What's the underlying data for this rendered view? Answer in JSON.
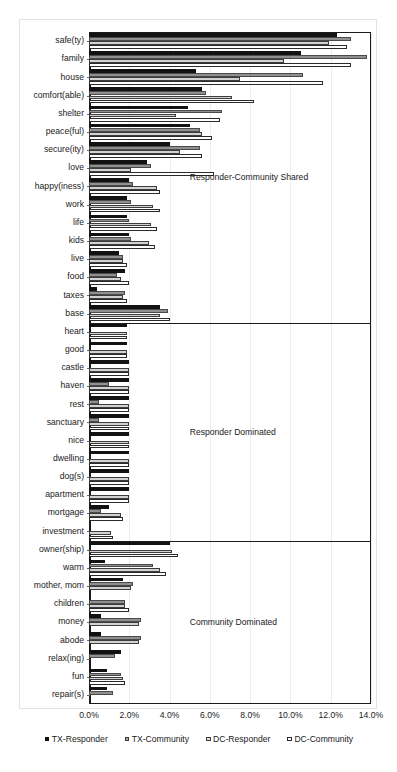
{
  "chart_data": {
    "type": "bar",
    "orientation": "horizontal",
    "title": "",
    "xlabel": "",
    "ylabel": "",
    "xlim": [
      0,
      14
    ],
    "xticks": [
      "0.0%",
      "2.0%",
      "4.0%",
      "6.0%",
      "8.0%",
      "10.0%",
      "12.0%",
      "14.0%"
    ],
    "xtick_values": [
      0,
      2,
      4,
      6,
      8,
      10,
      12,
      14
    ],
    "grid": true,
    "legend_position": "bottom",
    "categories": [
      "safe(ty)",
      "family",
      "house",
      "comfort(able)",
      "shelter",
      "peace(ful)",
      "secure(ity)",
      "love",
      "happy(iness)",
      "work",
      "life",
      "kids",
      "live",
      "food",
      "taxes",
      "base",
      "heart",
      "good",
      "castle",
      "haven",
      "rest",
      "sanctuary",
      "nice",
      "dwelling",
      "dog(s)",
      "apartment",
      "mortgage",
      "investment",
      "owner(ship)",
      "warm",
      "mother, mom",
      "children",
      "money",
      "abode",
      "relax(ing)",
      "fun",
      "repair(s)"
    ],
    "series": [
      {
        "name": "TX-Responder",
        "color": "#121212",
        "values": [
          12.3,
          10.5,
          5.3,
          5.6,
          4.9,
          5.0,
          4.0,
          2.9,
          2.0,
          1.9,
          1.9,
          2.0,
          1.5,
          1.8,
          0.4,
          3.5,
          1.9,
          1.9,
          2.0,
          2.0,
          2.0,
          2.0,
          2.0,
          2.0,
          2.0,
          2.0,
          1.0,
          0.0,
          4.0,
          0.8,
          1.7,
          0.0,
          0.6,
          0.6,
          1.6,
          0.9,
          0.9
        ]
      },
      {
        "name": "TX-Community",
        "color": "#8f8f8f",
        "values": [
          13.0,
          13.8,
          10.6,
          5.8,
          6.6,
          5.5,
          5.5,
          3.1,
          2.2,
          2.1,
          2.0,
          2.1,
          1.7,
          1.4,
          1.8,
          3.9,
          0.0,
          0.0,
          0.0,
          1.0,
          0.5,
          0.5,
          0.0,
          0.0,
          0.0,
          0.0,
          0.6,
          0.0,
          0.0,
          3.2,
          2.2,
          1.8,
          2.6,
          2.6,
          1.3,
          1.6,
          1.2
        ]
      },
      {
        "name": "DC-Responder",
        "color": "#d2d2d2",
        "values": [
          11.9,
          9.7,
          7.5,
          7.1,
          4.3,
          5.6,
          4.5,
          2.1,
          3.4,
          3.2,
          3.1,
          3.0,
          1.7,
          1.6,
          1.7,
          3.5,
          1.9,
          1.9,
          2.0,
          2.0,
          2.0,
          2.0,
          2.0,
          2.0,
          2.0,
          2.0,
          1.6,
          1.1,
          4.1,
          3.5,
          2.1,
          1.8,
          2.5,
          2.5,
          0.0,
          1.7,
          0.0
        ]
      },
      {
        "name": "DC-Community",
        "color": "#ffffff",
        "values": [
          12.8,
          13.0,
          11.6,
          8.2,
          6.5,
          6.1,
          5.6,
          6.2,
          3.5,
          3.5,
          3.4,
          3.3,
          1.9,
          2.0,
          1.9,
          4.0,
          1.9,
          1.9,
          2.0,
          2.0,
          2.0,
          2.0,
          2.0,
          2.0,
          2.0,
          2.0,
          1.7,
          1.2,
          4.4,
          3.8,
          0.0,
          2.0,
          0.0,
          0.0,
          0.0,
          1.8,
          0.0
        ]
      }
    ],
    "annotations": [
      {
        "label": "Responder-Community Shared",
        "after_category": "base"
      },
      {
        "label": "Responder Dominated",
        "after_category": "investment"
      },
      {
        "label": "Community Dominated",
        "after_category": "repair(s)"
      }
    ]
  },
  "legend": {
    "items": [
      {
        "label": "TX-Responder"
      },
      {
        "label": "TX-Community"
      },
      {
        "label": "DC-Responder"
      },
      {
        "label": "DC-Community"
      }
    ]
  }
}
